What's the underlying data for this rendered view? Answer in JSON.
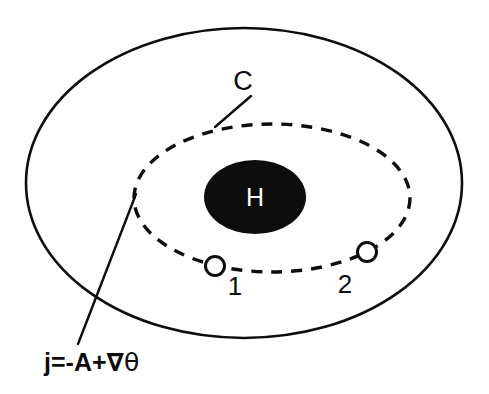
{
  "figure": {
    "background_color": "#ffffff",
    "ink_color": "#0d0d0d",
    "width": 489,
    "height": 394
  },
  "outer_boundary": {
    "name": "superconductor-boundary",
    "shape": "ellipse",
    "cx": 244,
    "cy": 183,
    "rx": 218,
    "ry": 155,
    "stroke": "#0d0d0d",
    "stroke_width": 2.6,
    "fill": "none",
    "line_style": "solid"
  },
  "contour": {
    "name": "integration-contour-C",
    "label": "C",
    "shape": "ellipse",
    "cx": 272,
    "cy": 198,
    "rx": 138,
    "ry": 74,
    "stroke": "#0d0d0d",
    "stroke_width": 3.4,
    "fill": "none",
    "line_style": "dashed",
    "dash_pattern": "11 9",
    "label_x": 243,
    "label_y": 90,
    "leader_from_x": 251,
    "leader_from_y": 96,
    "leader_to_x": 215,
    "leader_to_y": 127
  },
  "hole": {
    "name": "hole-region-H",
    "label": "H",
    "shape": "ellipse",
    "cx": 255,
    "cy": 197,
    "rx": 51,
    "ry": 37,
    "fill": "#0d0d0d",
    "label_color": "#ffffff",
    "label_x": 255,
    "label_y": 206
  },
  "junctions": [
    {
      "name": "junction-1",
      "label": "1",
      "cx": 215,
      "cy": 266,
      "r": 9.5,
      "stroke": "#0d0d0d",
      "stroke_width": 3,
      "fill": "#ffffff",
      "label_x": 235,
      "label_y": 295
    },
    {
      "name": "junction-2",
      "label": "2",
      "cx": 367,
      "cy": 252,
      "r": 9.5,
      "stroke": "#0d0d0d",
      "stroke_width": 3,
      "fill": "#ffffff",
      "label_x": 345,
      "label_y": 293
    }
  ],
  "current_annotation": {
    "name": "supercurrent-equation",
    "expression_plain": "j=-A+∇θ",
    "symbol_current": "j",
    "equals": "=",
    "minus": "-",
    "symbol_vector_potential": "A",
    "plus": "+",
    "symbol_nabla": "∇",
    "symbol_theta": "θ",
    "text_x": 44,
    "text_y": 371,
    "leader_from_x": 136,
    "leader_from_y": 194,
    "leader_to_x": 78,
    "leader_to_y": 344,
    "stroke": "#0d0d0d",
    "stroke_width": 2.4
  }
}
